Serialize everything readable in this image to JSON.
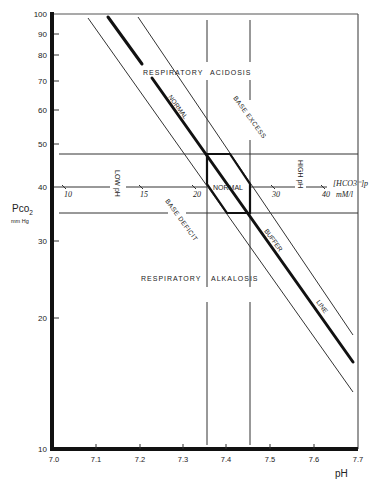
{
  "diagram": {
    "type": "acid-base nomogram (log Pco2 vs pH)",
    "x_axis": {
      "label": "pH",
      "ticks": [
        "7.0",
        "7.1",
        "7.2",
        "7.3",
        "7.4",
        "7.5",
        "7.6",
        "7.7"
      ],
      "range": [
        7.0,
        7.7
      ]
    },
    "y_axis": {
      "label": "Pco2",
      "label_sub": "2",
      "label_main": "Pco",
      "unit": "mm Hg",
      "scale": "log",
      "ticks": [
        "100",
        "90",
        "80",
        "70",
        "60",
        "50",
        "40",
        "30",
        "20",
        "10"
      ],
      "range": [
        10,
        100
      ]
    },
    "bicarbonate_scale": {
      "label": "[HCO3⁻]p",
      "unit": "mM/l",
      "ticks": [
        "10",
        "15",
        "20",
        "30",
        "40"
      ]
    },
    "regions": {
      "respiratory_acidosis": [
        "RESPIRATORY",
        "ACIDOSIS"
      ],
      "respiratory_alkalosis": [
        "RESPIRATORY",
        "ALKALOSIS"
      ],
      "normal_box": "NORMAL",
      "low_ph": "LOW pH",
      "high_ph": "HIGH pH",
      "base_excess": "BASE EXCESS",
      "base_deficit": "BASE DEFICIT"
    },
    "lines": {
      "normal_buffer_upper": "NORMAL",
      "buffer_line_parts": [
        "BUFFER",
        "LINE"
      ]
    },
    "normal_ranges": {
      "pco2": [
        35,
        48
      ],
      "ph": [
        7.355,
        7.45
      ]
    }
  }
}
